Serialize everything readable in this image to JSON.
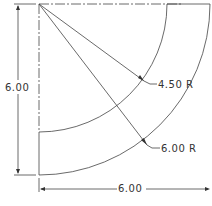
{
  "drawing": {
    "type": "quarter-annulus technical drawing",
    "center": {
      "x": 39,
      "y": 4
    },
    "outer_radius_label": "6.00 R",
    "inner_radius_label": "4.50 R",
    "height_dimension_label": "6.00",
    "width_dimension_label": "6.00",
    "colors": {
      "line": "#444444",
      "background": "#ffffff"
    }
  }
}
